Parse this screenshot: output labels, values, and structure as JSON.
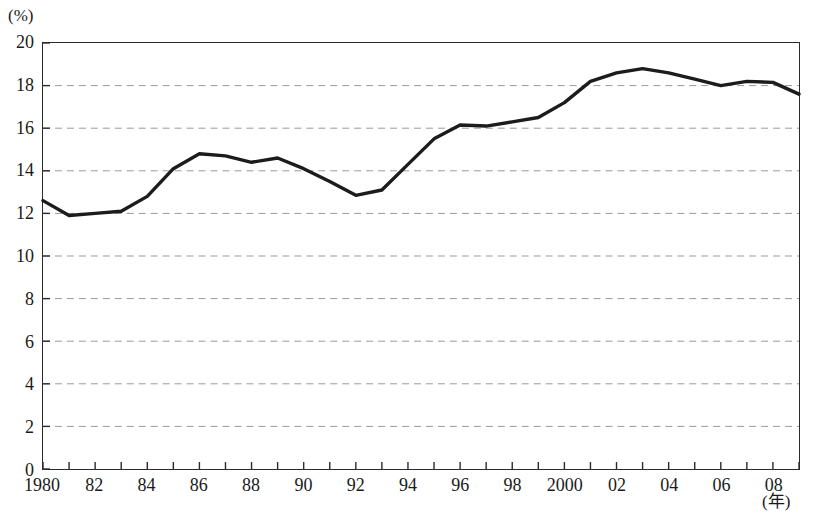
{
  "axes": {
    "y_unit_label": "(%)",
    "x_unit_label": "(年)",
    "y_tick_labels": [
      "20",
      "18",
      "16",
      "14",
      "12",
      "10",
      "8",
      "6",
      "4",
      "2",
      "0"
    ],
    "x_tick_labels": [
      "1980",
      "82",
      "84",
      "86",
      "88",
      "90",
      "92",
      "94",
      "96",
      "98",
      "2000",
      "02",
      "04",
      "06",
      "08"
    ]
  },
  "caption": {
    "text": ""
  },
  "colors": {
    "line": "#1c1c1c",
    "frame": "#2b2b2b",
    "grid": "#9a9a9a",
    "background": "#ffffff"
  },
  "chart_data": {
    "type": "line",
    "title": "",
    "subtitle": "",
    "xlabel": "(年)",
    "ylabel": "(%)",
    "xlim": [
      1980,
      2009
    ],
    "ylim": [
      0,
      20
    ],
    "ytick_step": 2,
    "xtick_step": 1,
    "xtick_label_step": 2,
    "grid": true,
    "grid_axis": "y",
    "grid_style": "dashed",
    "legend": false,
    "legend_position": "none",
    "x": [
      1980,
      1981,
      1982,
      1983,
      1984,
      1985,
      1986,
      1987,
      1988,
      1989,
      1990,
      1991,
      1992,
      1993,
      1994,
      1995,
      1996,
      1997,
      1998,
      1999,
      2000,
      2001,
      2002,
      2003,
      2004,
      2005,
      2006,
      2007,
      2008,
      2009
    ],
    "series": [
      {
        "name": "",
        "values": [
          12.6,
          11.9,
          12.0,
          12.1,
          12.8,
          14.1,
          14.8,
          14.7,
          14.4,
          14.6,
          14.1,
          13.5,
          12.85,
          13.1,
          14.3,
          15.5,
          16.15,
          16.1,
          16.3,
          16.5,
          17.2,
          18.2,
          18.6,
          18.8,
          18.6,
          18.3,
          18.0,
          18.2,
          18.15,
          17.6
        ]
      }
    ]
  }
}
